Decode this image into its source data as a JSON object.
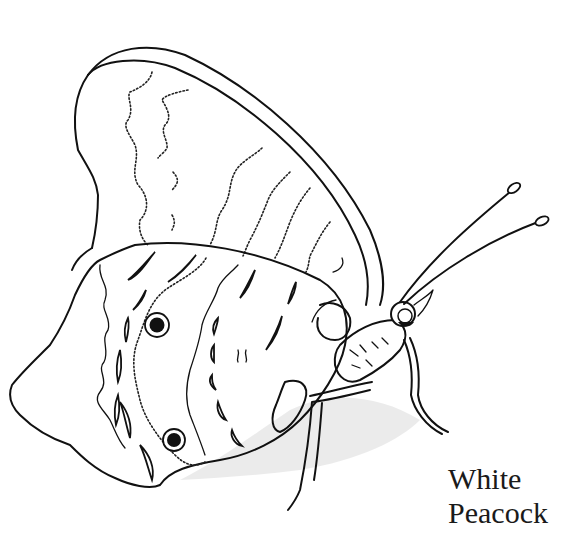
{
  "caption": {
    "line1": "White",
    "line2": "Peacock"
  },
  "illustration": {
    "subject": "butterfly",
    "style": "black-and-white line drawing",
    "colors": {
      "line": "#111111",
      "background": "#ffffff"
    }
  }
}
